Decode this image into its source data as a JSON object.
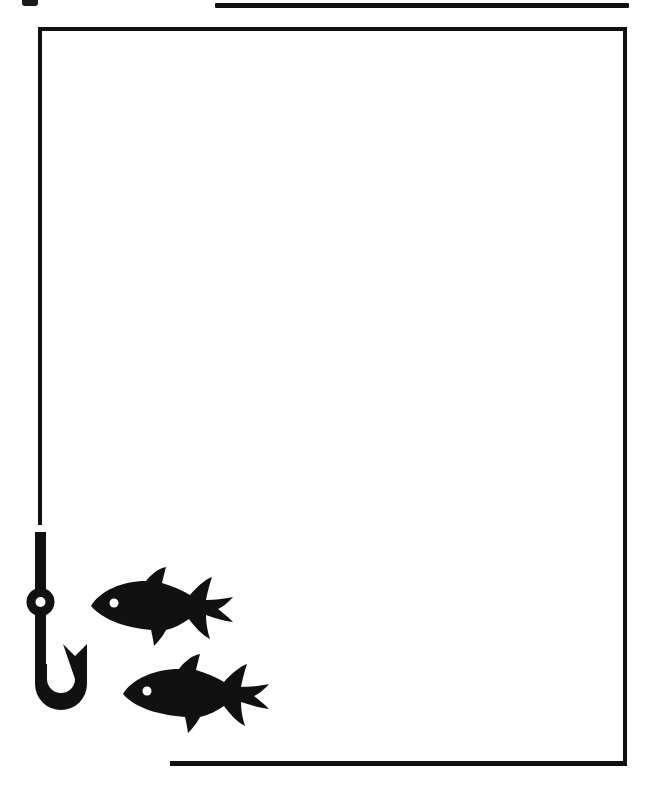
{
  "document": {
    "title": "Fishing Clip Art Page",
    "kind": "scanned-line-art-page",
    "page_width": 650,
    "page_height": 787,
    "background_color": "#ffffff",
    "ink_color": "#111111"
  },
  "rules": {
    "top_rule": {
      "name": "top-horizontal-rule",
      "x": 215,
      "y": 3,
      "width": 414,
      "height": 5,
      "color": "#111111"
    },
    "bottom_rule": {
      "name": "bottom-horizontal-rule",
      "x": 170,
      "y": 761,
      "width": 457,
      "height": 5,
      "color": "#111111"
    }
  },
  "frame": {
    "name": "open-rectangle-frame",
    "x": 38,
    "y": 27,
    "width": 589,
    "height": 739,
    "stroke_width": 4,
    "color": "#111111",
    "left_edge_stops_at_y": 525,
    "bottom_edge_starts_at_x": 170,
    "note": "left border doubles as the fishing line; it breaks where the hook begins"
  },
  "artwork": {
    "hook": {
      "name": "fishing-hook",
      "x": 18,
      "y": 524,
      "width": 80,
      "height": 200,
      "color": "#111111",
      "parts": [
        "line",
        "shank",
        "eye-bead",
        "bend",
        "barb"
      ],
      "eye_hole_color": "#ffffff"
    },
    "fish": [
      {
        "name": "fish-silhouette-upper",
        "x": 88,
        "y": 566,
        "width": 148,
        "height": 82,
        "color": "#111111",
        "facing": "left",
        "eye_color": "#ffffff"
      },
      {
        "name": "fish-silhouette-lower",
        "x": 120,
        "y": 652,
        "width": 152,
        "height": 82,
        "color": "#111111",
        "facing": "left",
        "eye_color": "#ffffff"
      }
    ]
  },
  "corner_mark": {
    "name": "top-left-scan-artifact",
    "x": 22,
    "y": -6,
    "width": 16,
    "height": 12,
    "color": "#1a1a1a"
  }
}
